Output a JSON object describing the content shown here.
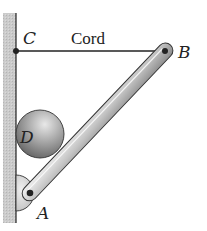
{
  "diagram": {
    "type": "statics-free-body-setup",
    "labels": {
      "C": "C",
      "cord": "Cord",
      "B": "B",
      "D": "D",
      "A": "A"
    },
    "components": {
      "wall": {
        "description": "vertical wall on left",
        "color": "#c8c8c8"
      },
      "cord": {
        "from": "C",
        "to": "B",
        "orientation": "horizontal"
      },
      "rod": {
        "from": "A",
        "to": "B",
        "description": "uniform rod pinned at A"
      },
      "ball": {
        "label": "D",
        "description": "sphere resting between wall and rod"
      },
      "support_A": {
        "description": "semicircular pin support on wall"
      }
    },
    "colors": {
      "line": "#222222",
      "rod_fill": "#d0d0d0",
      "ball_fill": "#9a9a9a",
      "wall_fill": "#c9c9c9"
    }
  }
}
